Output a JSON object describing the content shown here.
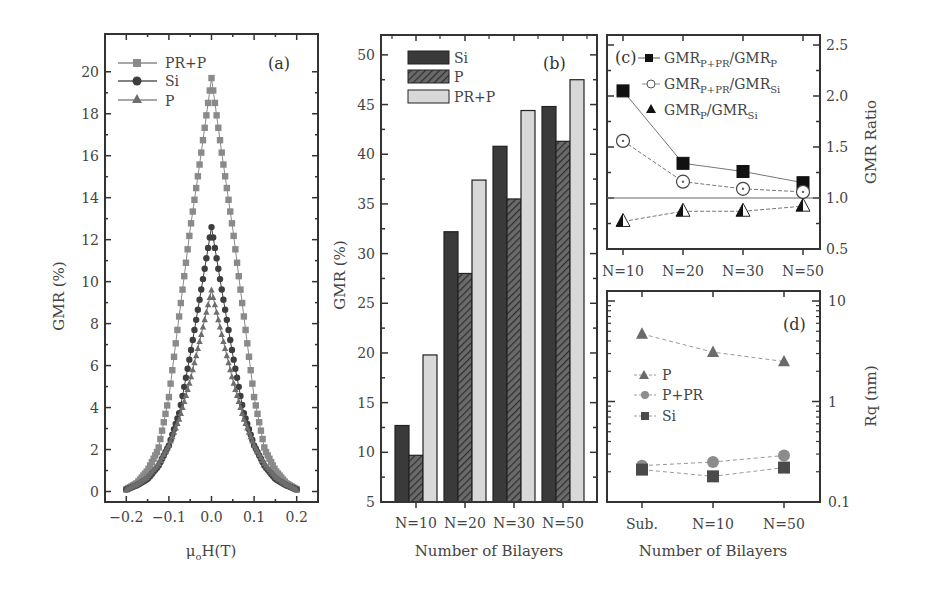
{
  "chart_data": [
    {
      "panel": "(a)",
      "type": "line",
      "xlabel": "μoH(T)",
      "ylabel": "GMR (%)",
      "xlim": [
        -0.25,
        0.25
      ],
      "ylim": [
        -0.5,
        21.8
      ],
      "xticks": [
        "-0.2",
        "-0.1",
        "0.0",
        "0.1",
        "0.2"
      ],
      "yticks": [
        "0",
        "2",
        "4",
        "6",
        "8",
        "10",
        "12",
        "14",
        "16",
        "18",
        "20"
      ],
      "legend": [
        "PR+P",
        "Si",
        "P"
      ],
      "x": [
        -0.2,
        -0.175,
        -0.15,
        -0.125,
        -0.1,
        -0.075,
        -0.05,
        -0.025,
        0,
        0.025,
        0.05,
        0.075,
        0.1,
        0.125,
        0.15,
        0.175,
        0.2
      ],
      "series": [
        {
          "name": "PR+P",
          "marker": "square",
          "color": "#8a8a8a",
          "values": [
            0.1,
            0.4,
            1.0,
            2.0,
            4.5,
            8.5,
            12.5,
            16.0,
            19.7,
            16.0,
            12.5,
            8.5,
            4.5,
            2.0,
            1.0,
            0.4,
            0.1
          ]
        },
        {
          "name": "Si",
          "marker": "circle",
          "color": "#3e3e3e",
          "values": [
            0.1,
            0.3,
            0.6,
            1.2,
            2.2,
            3.8,
            6.5,
            9.5,
            12.6,
            9.5,
            6.5,
            3.8,
            2.2,
            1.2,
            0.6,
            0.3,
            0.1
          ]
        },
        {
          "name": "P",
          "marker": "triangle",
          "color": "#6e6e6e",
          "values": [
            0.1,
            0.35,
            0.7,
            1.3,
            2.2,
            3.5,
            5.3,
            7.4,
            9.6,
            7.4,
            5.3,
            3.5,
            2.2,
            1.3,
            0.7,
            0.35,
            0.1
          ]
        }
      ]
    },
    {
      "panel": "(b)",
      "type": "bar",
      "xlabel": "Number of Bilayers",
      "ylabel": "GMR (%)",
      "ylim": [
        5,
        52
      ],
      "yticks": [
        "5",
        "10",
        "15",
        "20",
        "25",
        "30",
        "35",
        "40",
        "45",
        "50"
      ],
      "categories": [
        "N=10",
        "N=20",
        "N=30",
        "N=50"
      ],
      "legend": [
        "Si",
        "P",
        "PR+P"
      ],
      "series": [
        {
          "name": "Si",
          "fill": "#3a3a3a",
          "hatch": false,
          "values": [
            12.7,
            32.2,
            40.8,
            44.8
          ]
        },
        {
          "name": "P",
          "fill": "#555555",
          "hatch": true,
          "values": [
            9.7,
            28.0,
            35.5,
            41.3
          ]
        },
        {
          "name": "PR+P",
          "fill": "#d8d8d8",
          "hatch": false,
          "values": [
            19.8,
            37.4,
            44.4,
            47.5
          ]
        }
      ]
    },
    {
      "panel": "(c)",
      "type": "line",
      "ylabel": "GMR Ratio",
      "ylim": [
        0.5,
        2.6
      ],
      "yticks": [
        "0.5",
        "1.0",
        "1.5",
        "2.0",
        "2.5"
      ],
      "categories": [
        "N=10",
        "N=20",
        "N=30",
        "N=50"
      ],
      "reference_line": 1.0,
      "legend": [
        "GMR_P+PR/GMR_P",
        "GMR_P+PR/GMR_Si",
        "GMR_P/GMR_Si"
      ],
      "series": [
        {
          "name": "GMR_P+PR/GMR_P",
          "marker": "filled-square",
          "values": [
            2.05,
            1.34,
            1.26,
            1.15
          ]
        },
        {
          "name": "GMR_P+PR/GMR_Si",
          "marker": "open-circle",
          "values": [
            1.56,
            1.16,
            1.09,
            1.06
          ]
        },
        {
          "name": "GMR_P/GMR_Si",
          "marker": "half-triangle",
          "values": [
            0.77,
            0.87,
            0.87,
            0.92
          ]
        }
      ]
    },
    {
      "panel": "(d)",
      "type": "line",
      "xlabel": "Number of Bilayers",
      "ylabel": "Rq (nm)",
      "yscale": "log",
      "ylim": [
        0.1,
        10
      ],
      "yticks": [
        "0.1",
        "1",
        "10"
      ],
      "categories": [
        "Sub.",
        "N=10",
        "N=50"
      ],
      "legend": [
        "P",
        "P+PR",
        "Si"
      ],
      "series": [
        {
          "name": "P",
          "marker": "triangle",
          "color": "#6a6a6a",
          "values": [
            4.7,
            3.1,
            2.5
          ]
        },
        {
          "name": "P+PR",
          "marker": "circle",
          "color": "#8c8c8c",
          "values": [
            0.23,
            0.25,
            0.29
          ]
        },
        {
          "name": "Si",
          "marker": "square",
          "color": "#4a4a4a",
          "values": [
            0.21,
            0.18,
            0.22
          ]
        }
      ]
    }
  ],
  "labels": {
    "a": {
      "panel": "(a)",
      "ylabel": "GMR (%)",
      "xlabel_main": "μ",
      "xlabel_sub": "o",
      "xlabel_rest": "H(T)",
      "legend": [
        "PR+P",
        "Si",
        "P"
      ],
      "yticks": [
        "0",
        "2",
        "4",
        "6",
        "8",
        "10",
        "12",
        "14",
        "16",
        "18",
        "20"
      ],
      "xticks": [
        "−0.2",
        "−0.1",
        "0.0",
        "0.1",
        "0.2"
      ]
    },
    "b": {
      "panel": "(b)",
      "ylabel": "GMR (%)",
      "xlabel": "Number of Bilayers",
      "legend": [
        "Si",
        "P",
        "PR+P"
      ],
      "yticks": [
        "5",
        "10",
        "15",
        "20",
        "25",
        "30",
        "35",
        "40",
        "45",
        "50"
      ],
      "xticks": [
        "N=10",
        "N=20",
        "N=30",
        "N=50"
      ]
    },
    "c": {
      "panel": "(c)",
      "ylabel": "GMR Ratio",
      "legend": [
        {
          "main": "GMR",
          "sub1": "P+PR",
          "mid": "/GMR",
          "sub2": "P"
        },
        {
          "main": "GMR",
          "sub1": "P+PR",
          "mid": "/GMR",
          "sub2": "Si"
        },
        {
          "main": "GMR",
          "sub1": "P",
          "mid": "/GMR",
          "sub2": "Si"
        }
      ],
      "yticks": [
        "0.5",
        "1.0",
        "1.5",
        "2.0",
        "2.5"
      ],
      "xticks": [
        "N=10",
        "N=20",
        "N=30",
        "N=50"
      ]
    },
    "d": {
      "panel": "(d)",
      "ylabel": "Rq (nm)",
      "xlabel": "Number of Bilayers",
      "legend": [
        "P",
        "P+PR",
        "Si"
      ],
      "yticks": [
        "0.1",
        "1",
        "10"
      ],
      "xticks": [
        "Sub.",
        "N=10",
        "N=50"
      ]
    }
  }
}
